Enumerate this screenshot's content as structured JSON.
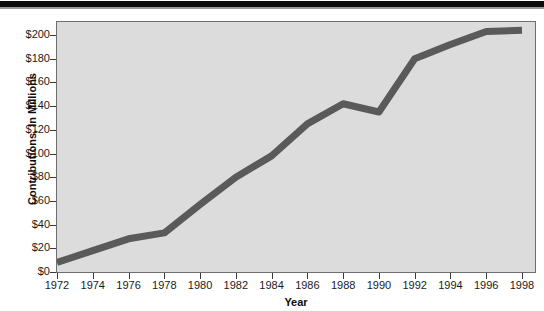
{
  "chart_data": {
    "type": "line",
    "title": "",
    "xlabel": "Year",
    "ylabel": "Contributions, In Millions",
    "xlim": [
      1972,
      1998
    ],
    "ylim": [
      0,
      210
    ],
    "grid": false,
    "legend": "none",
    "x_tick_labels": [
      "1972",
      "1974",
      "1976",
      "1978",
      "1980",
      "1982",
      "1984",
      "1986",
      "1988",
      "1990",
      "1992",
      "1994",
      "1996",
      "1998"
    ],
    "x_tick_values": [
      1972,
      1974,
      1976,
      1978,
      1980,
      1982,
      1984,
      1986,
      1988,
      1990,
      1992,
      1994,
      1996,
      1998
    ],
    "y_tick_labels": [
      "$0",
      "$20",
      "$40",
      "$60",
      "$80",
      "$100",
      "$120",
      "$140",
      "$160",
      "$180",
      "$200"
    ],
    "y_tick_values": [
      0,
      20,
      40,
      60,
      80,
      100,
      120,
      140,
      160,
      180,
      200
    ],
    "x": [
      1972,
      1974,
      1976,
      1978,
      1980,
      1982,
      1984,
      1986,
      1988,
      1990,
      1992,
      1994,
      1996,
      1998
    ],
    "values": [
      8,
      18,
      28,
      33,
      57,
      80,
      98,
      125,
      142,
      135,
      180,
      192,
      203,
      204
    ],
    "series": [
      {
        "name": "Contributions",
        "values": [
          8,
          18,
          28,
          33,
          57,
          80,
          98,
          125,
          142,
          135,
          180,
          192,
          203,
          204
        ],
        "color": "#5a5a5a",
        "line_width": 7
      }
    ],
    "plot_background": "#dcdcdc",
    "page_background": "#ffffff",
    "axis_color": "#6e6e6e",
    "text_color": "#1a1a1a"
  },
  "figure": {
    "top_rule_color": "#0c0c0c"
  }
}
